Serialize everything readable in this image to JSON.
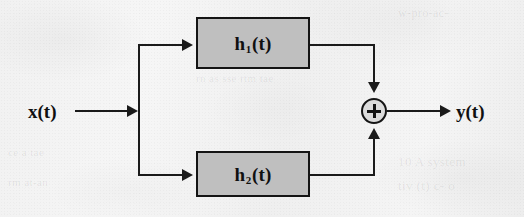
{
  "figure": {
    "type": "block-diagram",
    "background": "#f3f3f3",
    "ink_color": "#1a1a1a",
    "block_fill": "#bfbfbf"
  },
  "signals": {
    "input_label": "x(t)",
    "output_label": "y(t)"
  },
  "blocks": [
    {
      "id": "h1",
      "base": "h",
      "subscript": "1",
      "arg": "(t)",
      "label": "h₁(t)"
    },
    {
      "id": "h2",
      "base": "h",
      "subscript": "2",
      "arg": "(t)",
      "label": "h₂(t)"
    }
  ],
  "adder": {
    "operator": "+",
    "name": "summing-junction"
  },
  "ghost_text": [
    {
      "text": "w-pro-ac-",
      "x": 398,
      "y": 6,
      "size": 12
    },
    {
      "text": "ae ss-ae ae a'-sa-",
      "x": 196,
      "y": 56,
      "size": 11
    },
    {
      "text": "rn as sse rtm tae",
      "x": 196,
      "y": 72,
      "size": 11
    },
    {
      "text": "10 A system",
      "x": 398,
      "y": 154,
      "size": 13
    },
    {
      "text": "tiv (t) c- o",
      "x": 398,
      "y": 178,
      "size": 13
    },
    {
      "text": "ce a tae",
      "x": 8,
      "y": 146,
      "size": 11
    },
    {
      "text": "rm at-an",
      "x": 8,
      "y": 176,
      "size": 11
    }
  ]
}
